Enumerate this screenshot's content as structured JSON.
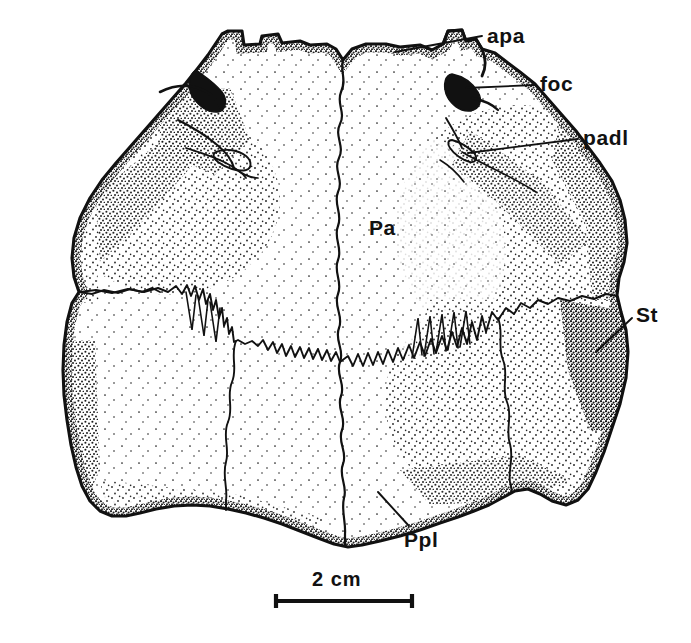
{
  "figure": {
    "kind": "scientific-line-drawing",
    "technique": "pen-and-ink stipple",
    "background_color": "#ffffff",
    "ink_color": "#111111",
    "width": 691,
    "height": 643
  },
  "labels": {
    "apa": "apa",
    "foc": "foc",
    "padl": "padl",
    "pa": "Pa",
    "st": "St",
    "ppl": "Ppl"
  },
  "leaders": [
    {
      "name": "apa",
      "from": [
        482,
        36
      ],
      "to": [
        395,
        52
      ]
    },
    {
      "name": "foc",
      "from": [
        535,
        85
      ],
      "to": [
        466,
        88
      ]
    },
    {
      "name": "padl",
      "from": [
        578,
        139
      ],
      "to": [
        468,
        153
      ]
    },
    {
      "name": "st",
      "from": [
        632,
        318
      ],
      "to": [
        596,
        352
      ]
    },
    {
      "name": "ppl",
      "from": [
        409,
        526
      ],
      "to": [
        378,
        492
      ]
    }
  ],
  "scale_bar": {
    "label": "2 cm",
    "length_value": 2,
    "length_unit": "cm",
    "x_start": 275,
    "x_end": 413,
    "y": 601,
    "cap_height": 13
  }
}
